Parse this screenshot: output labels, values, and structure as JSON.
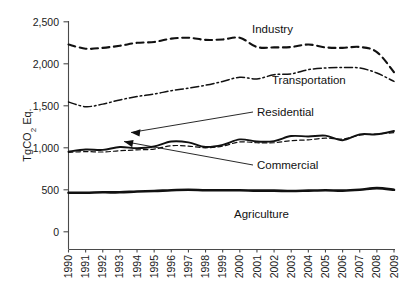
{
  "chart_data": {
    "type": "line",
    "title": "",
    "subtitle": "",
    "xlabel": "",
    "ylabel": "TgCO2 Eq.",
    "ylabel_parts": {
      "pre": "TgCO",
      "sub": "2",
      "post": " Eq."
    },
    "x": [
      1990,
      1991,
      1992,
      1993,
      1994,
      1995,
      1996,
      1997,
      1998,
      1999,
      2000,
      2001,
      2002,
      2003,
      2004,
      2005,
      2006,
      2007,
      2008,
      2009
    ],
    "categories": [
      "1990",
      "1991",
      "1992",
      "1993",
      "1994",
      "1995",
      "1996",
      "1997",
      "1998",
      "1999",
      "2000",
      "2001",
      "2002",
      "2003",
      "2004",
      "2005",
      "2006",
      "2007",
      "2008",
      "2009"
    ],
    "ylim": [
      0,
      2500
    ],
    "yticks": [
      0,
      500,
      1000,
      1500,
      2000,
      2500
    ],
    "ytick_labels": [
      "0",
      "500",
      "1,000",
      "1,500",
      "2,000",
      "2,500"
    ],
    "grid": false,
    "legend_position": "inline-annotations",
    "series": [
      {
        "name": "Industry",
        "style": "dashed",
        "values": [
          2230,
          2180,
          2190,
          2215,
          2250,
          2260,
          2300,
          2310,
          2285,
          2290,
          2310,
          2200,
          2195,
          2200,
          2230,
          2195,
          2190,
          2200,
          2140,
          1900
        ]
      },
      {
        "name": "Transportation",
        "style": "dash-dot",
        "values": [
          1545,
          1490,
          1520,
          1570,
          1610,
          1640,
          1680,
          1710,
          1745,
          1790,
          1840,
          1820,
          1870,
          1880,
          1930,
          1950,
          1955,
          1950,
          1890,
          1790
        ]
      },
      {
        "name": "Residential",
        "style": "solid-thin",
        "values": [
          955,
          980,
          975,
          1010,
          995,
          1015,
          1075,
          1065,
          1010,
          1035,
          1100,
          1075,
          1080,
          1140,
          1135,
          1145,
          1090,
          1160,
          1160,
          1200
        ]
      },
      {
        "name": "Commercial",
        "style": "dashed-thin",
        "values": [
          945,
          955,
          950,
          965,
          975,
          985,
          1025,
          1020,
          1000,
          1020,
          1070,
          1060,
          1060,
          1085,
          1095,
          1115,
          1105,
          1150,
          1165,
          1180
        ]
      },
      {
        "name": "Agriculture",
        "style": "solid-thick",
        "values": [
          465,
          465,
          470,
          470,
          480,
          485,
          495,
          500,
          495,
          495,
          495,
          490,
          490,
          485,
          490,
          495,
          490,
          500,
          520,
          500
        ]
      }
    ],
    "annotations": [
      {
        "name": "Industry",
        "label": "Industry",
        "leader": false
      },
      {
        "name": "Transportation",
        "label": "Transportation",
        "leader": false
      },
      {
        "name": "Residential",
        "label": "Residential",
        "leader": true
      },
      {
        "name": "Commercial",
        "label": "Commercial",
        "leader": true
      },
      {
        "name": "Agriculture",
        "label": "Agriculture",
        "leader": false
      }
    ],
    "colors": {
      "line": "#111111",
      "axis": "#4a4a4a",
      "text": "#1a1a1a",
      "background": "#ffffff"
    }
  }
}
